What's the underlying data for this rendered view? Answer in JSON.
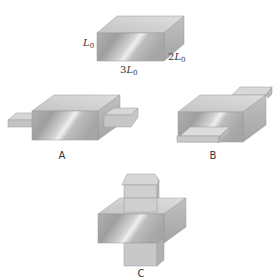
{
  "figure": {
    "reference_block": {
      "dimensions": {
        "height": "L",
        "height_sub": "0",
        "width_prefix": "3",
        "width": "L",
        "width_sub": "0",
        "depth_prefix": "2",
        "depth": "L",
        "depth_sub": "0"
      }
    },
    "variants": [
      {
        "id": "A",
        "label": "A",
        "description": "block with bars protruding from left and right faces"
      },
      {
        "id": "B",
        "label": "B",
        "description": "block with bars protruding front and back"
      },
      {
        "id": "C",
        "label": "C",
        "description": "block with bars protruding top and bottom"
      }
    ]
  },
  "colors": {
    "front_light": "#e6e6e6",
    "front_dark": "#a8a8a8",
    "top": "#d2d2d2",
    "side": "#b4b4b4",
    "tab": "#c8c8c8",
    "tab_edge": "#9a9a9a"
  }
}
